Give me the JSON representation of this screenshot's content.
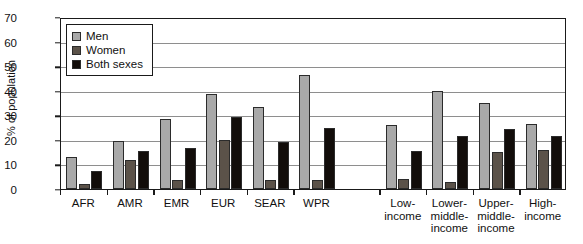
{
  "chart_data": {
    "type": "bar",
    "title": "",
    "xlabel": "",
    "ylabel": "% of population",
    "ylim": [
      0,
      70
    ],
    "ytick_step": 10,
    "yticks": [
      0,
      10,
      20,
      30,
      40,
      50,
      60,
      70
    ],
    "grid": true,
    "legend_position": "top-left",
    "categories": [
      "AFR",
      "AMR",
      "EMR",
      "EUR",
      "SEAR",
      "WPR",
      "Low-income",
      "Lower-middle-income",
      "Upper-middle-income",
      "High-income"
    ],
    "category_label_lines": [
      [
        "AFR"
      ],
      [
        "AMR"
      ],
      [
        "EMR"
      ],
      [
        "EUR"
      ],
      [
        "SEAR"
      ],
      [
        "WPR"
      ],
      [
        "Low-",
        "income"
      ],
      [
        "Lower-",
        "middle-",
        "income"
      ],
      [
        "Upper-",
        "middle-",
        "income"
      ],
      [
        "High-",
        "income"
      ]
    ],
    "group_gap_after_index": 5,
    "series": [
      {
        "name": "Men",
        "color": "#a9a9a9",
        "values": [
          13,
          19.5,
          28.5,
          38.5,
          33.5,
          46.5,
          26,
          40,
          35,
          26.5
        ]
      },
      {
        "name": "Women",
        "color": "#5b5249",
        "values": [
          2,
          12,
          3.5,
          20,
          3.5,
          3.5,
          4,
          3,
          15,
          16
        ]
      },
      {
        "name": "Both sexes",
        "color": "#120d0a",
        "values": [
          7.5,
          15.5,
          16.5,
          29.5,
          19,
          25,
          15.5,
          21.5,
          24.5,
          21.5
        ]
      }
    ]
  }
}
